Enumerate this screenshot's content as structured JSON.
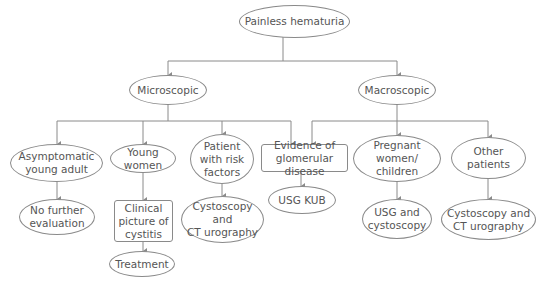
{
  "diagram": {
    "title": "Painless hematuria",
    "nodes": {
      "root": "Painless hematuria",
      "microscopic": "Microscopic",
      "macroscopic": "Macroscopic",
      "asymptomatic": "Asymptomatic\nyoung adult",
      "young_women": "Young\nwomen",
      "risk_factors": "Patient\nwith risk\nfactors",
      "glomerular": "Evidence of\nglomerular disease",
      "pregnant": "Pregnant women/\nchildren",
      "other": "Other\npatients",
      "no_further": "No further\nevaluation",
      "cystitis": "Clinical\npicture of\ncystitis",
      "cysto_ct_1": "Cystoscopy and\nCT urography",
      "usg_kub": "USG KUB",
      "usg_cysto": "USG and\ncystoscopy",
      "cysto_ct_2": "Cystoscopy and\nCT urography",
      "treatment": "Treatment"
    },
    "line_color": "#8a8a8a",
    "text_color": "#555555"
  }
}
